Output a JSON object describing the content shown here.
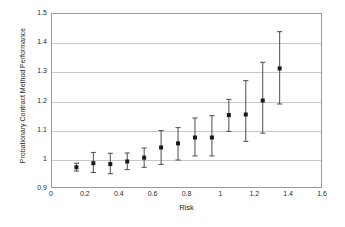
{
  "chart_data": {
    "type": "scatter",
    "title": "",
    "xlabel": "Risk",
    "ylabel": "Probationary Contract Method Performance",
    "xlim": [
      0,
      1.6
    ],
    "ylim": [
      0.9,
      1.5
    ],
    "xticks": [
      "0",
      "0.2",
      "0.4",
      "0.6",
      "0.8",
      "1",
      "1.2",
      "1.4",
      "1.6"
    ],
    "xtick_values": [
      0,
      0.2,
      0.4,
      0.6,
      0.8,
      1.0,
      1.2,
      1.4,
      1.6
    ],
    "yticks": [
      "0.9",
      "1",
      "1.1",
      "1.2",
      "1.3",
      "1.4",
      "1.5"
    ],
    "ytick_values": [
      0.9,
      1.0,
      1.1,
      1.2,
      1.3,
      1.4,
      1.5
    ],
    "grid": "horizontal",
    "legend": "none",
    "marker": "square",
    "marker_color": "#1a1a1a",
    "errorbar_color": "#4d4d4d",
    "x": [
      0.15,
      0.25,
      0.35,
      0.45,
      0.55,
      0.65,
      0.75,
      0.85,
      0.95,
      1.05,
      1.15,
      1.25,
      1.35
    ],
    "y": [
      0.971,
      0.985,
      0.982,
      0.991,
      1.004,
      1.039,
      1.053,
      1.073,
      1.073,
      1.15,
      1.152,
      1.2,
      1.31
    ],
    "y_upper": [
      0.985,
      1.022,
      1.019,
      1.02,
      1.037,
      1.097,
      1.107,
      1.14,
      1.148,
      1.204,
      1.268,
      1.331,
      1.436
    ],
    "y_lower": [
      0.958,
      0.953,
      0.949,
      0.963,
      0.971,
      0.981,
      0.996,
      1.01,
      1.01,
      1.094,
      1.06,
      1.088,
      1.188
    ],
    "series": [
      {
        "name": "Probationary Contract Method Performance vs Risk",
        "points": [
          {
            "x": 0.15,
            "y": 0.971,
            "low": 0.958,
            "high": 0.985
          },
          {
            "x": 0.25,
            "y": 0.985,
            "low": 0.953,
            "high": 1.022
          },
          {
            "x": 0.35,
            "y": 0.982,
            "low": 0.949,
            "high": 1.019
          },
          {
            "x": 0.45,
            "y": 0.991,
            "low": 0.963,
            "high": 1.02
          },
          {
            "x": 0.55,
            "y": 1.004,
            "low": 0.971,
            "high": 1.037
          },
          {
            "x": 0.65,
            "y": 1.039,
            "low": 0.981,
            "high": 1.097
          },
          {
            "x": 0.75,
            "y": 1.053,
            "low": 0.996,
            "high": 1.107
          },
          {
            "x": 0.85,
            "y": 1.073,
            "low": 1.01,
            "high": 1.14
          },
          {
            "x": 0.95,
            "y": 1.073,
            "low": 1.01,
            "high": 1.148
          },
          {
            "x": 1.05,
            "y": 1.15,
            "low": 1.094,
            "high": 1.204
          },
          {
            "x": 1.15,
            "y": 1.152,
            "low": 1.06,
            "high": 1.268
          },
          {
            "x": 1.25,
            "y": 1.2,
            "low": 1.088,
            "high": 1.331
          },
          {
            "x": 1.35,
            "y": 1.31,
            "low": 1.188,
            "high": 1.436
          }
        ]
      }
    ]
  }
}
